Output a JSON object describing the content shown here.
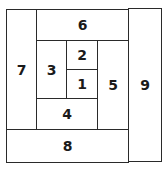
{
  "diagram": {
    "type": "log-cabin-block-layout",
    "pieces": [
      {
        "id": "1",
        "label": "1"
      },
      {
        "id": "2",
        "label": "2"
      },
      {
        "id": "3",
        "label": "3"
      },
      {
        "id": "4",
        "label": "4"
      },
      {
        "id": "5",
        "label": "5"
      },
      {
        "id": "6",
        "label": "6"
      },
      {
        "id": "7",
        "label": "7"
      },
      {
        "id": "8",
        "label": "8"
      },
      {
        "id": "9",
        "label": "9"
      }
    ]
  }
}
